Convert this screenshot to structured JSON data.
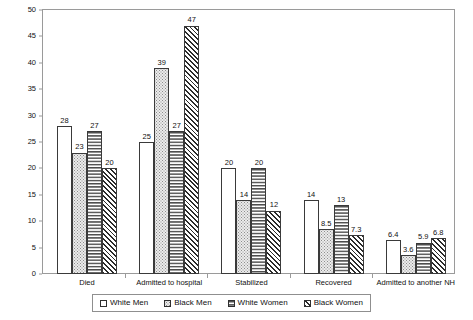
{
  "chart_data": {
    "type": "bar",
    "title": "",
    "xlabel": "",
    "ylabel": "Percent",
    "ylim": [
      0,
      50
    ],
    "ytick_step": 5,
    "yticks": [
      "0",
      "5",
      "10",
      "15",
      "20",
      "25",
      "30",
      "35",
      "40",
      "45",
      "50"
    ],
    "grid": false,
    "legend_position": "bottom",
    "categories": [
      "Died",
      "Admitted to hospital",
      "Stabilized",
      "Recovered",
      "Admitted to another NH"
    ],
    "series": [
      {
        "name": "White Men",
        "pattern": "solid-white",
        "values": [
          28,
          25,
          20,
          14,
          6.4
        ],
        "labels": [
          "28",
          "25",
          "20",
          "14",
          "6.4"
        ]
      },
      {
        "name": "Black Men",
        "pattern": "dotted",
        "values": [
          23,
          39,
          14,
          8.5,
          3.6
        ],
        "labels": [
          "23",
          "39",
          "14",
          "8.5",
          "3.6"
        ]
      },
      {
        "name": "White Women",
        "pattern": "horizontal-wave",
        "values": [
          27,
          27,
          20,
          13,
          5.9
        ],
        "labels": [
          "27",
          "27",
          "20",
          "13",
          "5.9"
        ]
      },
      {
        "name": "Black Women",
        "pattern": "diagonal-hatch",
        "values": [
          20,
          47,
          12,
          7.3,
          6.8
        ],
        "labels": [
          "20",
          "47",
          "12",
          "7.3",
          "6.8"
        ]
      }
    ]
  },
  "axis": {
    "y_title": "Percent"
  },
  "legend": {
    "items": [
      {
        "label": "White Men",
        "swatch": "legend-swatch-white-men"
      },
      {
        "label": "Black Men",
        "swatch": "legend-swatch-black-men"
      },
      {
        "label": "White Women",
        "swatch": "legend-swatch-white-women"
      },
      {
        "label": "Black Women",
        "swatch": "legend-swatch-black-women"
      }
    ]
  },
  "colors": {
    "frame": "#9a9a9a",
    "bar_outline": "#3a3a3a",
    "text": "#111111",
    "background": "#ffffff"
  }
}
